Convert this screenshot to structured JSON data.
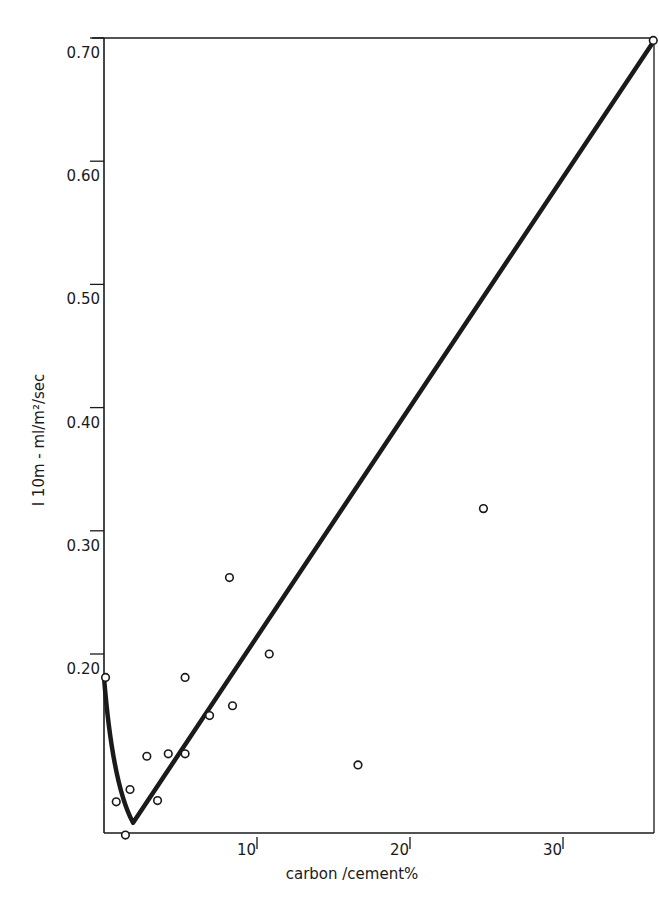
{
  "chart_data": {
    "type": "scatter",
    "title": "",
    "xlabel": "carbon /cement%",
    "ylabel": "I 10m - ml/m²/sec",
    "xlim": [
      0,
      36
    ],
    "ylim": [
      0.05,
      0.7
    ],
    "grid": false,
    "legend": null,
    "x_ticks": [
      {
        "value": 10,
        "label": "10"
      },
      {
        "value": 20,
        "label": "20"
      },
      {
        "value": 30,
        "label": "30"
      }
    ],
    "y_ticks": [
      {
        "value": 0.2,
        "label": "0.20"
      },
      {
        "value": 0.3,
        "label": "0.30"
      },
      {
        "value": 0.4,
        "label": "0.40"
      },
      {
        "value": 0.5,
        "label": "0.50"
      },
      {
        "value": 0.6,
        "label": "0.60"
      },
      {
        "value": 0.7,
        "label": "0.70"
      }
    ],
    "series": [
      {
        "name": "measured",
        "marker": "open-circle",
        "points": [
          {
            "x": 0.1,
            "y": 0.181
          },
          {
            "x": 0.8,
            "y": 0.08
          },
          {
            "x": 1.4,
            "y": 0.053
          },
          {
            "x": 1.7,
            "y": 0.09
          },
          {
            "x": 2.8,
            "y": 0.117
          },
          {
            "x": 3.5,
            "y": 0.081
          },
          {
            "x": 4.2,
            "y": 0.119
          },
          {
            "x": 5.3,
            "y": 0.181
          },
          {
            "x": 5.3,
            "y": 0.119
          },
          {
            "x": 6.9,
            "y": 0.15
          },
          {
            "x": 8.4,
            "y": 0.158
          },
          {
            "x": 8.2,
            "y": 0.262
          },
          {
            "x": 10.8,
            "y": 0.2
          },
          {
            "x": 16.6,
            "y": 0.11
          },
          {
            "x": 24.8,
            "y": 0.318
          },
          {
            "x": 35.9,
            "y": 0.698
          }
        ]
      },
      {
        "name": "fitted-curve",
        "style": "thick-line",
        "points": [
          {
            "x": 0.0,
            "y": 0.181
          },
          {
            "x": 0.6,
            "y": 0.12
          },
          {
            "x": 1.2,
            "y": 0.08
          },
          {
            "x": 1.9,
            "y": 0.063
          },
          {
            "x": 35.8,
            "y": 0.695
          }
        ]
      }
    ]
  },
  "plot": {
    "px_left": 104,
    "px_right": 654,
    "px_top": 38,
    "px_bottom": 833,
    "x0_px": 104,
    "px_per_x": 15.3,
    "y_ref_value": 0.2,
    "y_ref_px": 654,
    "px_per_y": 1232
  },
  "colors": {
    "ink": "#1a1a1a",
    "background": "#ffffff"
  }
}
